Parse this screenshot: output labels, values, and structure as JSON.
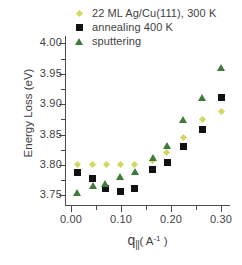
{
  "chart_data": {
    "type": "scatter",
    "title": "",
    "xlabel": "q|| ( A-1 )",
    "ylabel": "Energy Loss (eV)",
    "xlim": [
      -0.012,
      0.318
    ],
    "ylim": [
      3.7325,
      4.012
    ],
    "grid": false,
    "legend_position": "top-left-inside",
    "xticks": [
      0.0,
      0.1,
      0.2,
      0.3
    ],
    "xtick_labels": [
      "0.00",
      "0.10",
      "0.20",
      "0.30"
    ],
    "xticks_minor": [
      0.05,
      0.15,
      0.25
    ],
    "yticks": [
      3.75,
      3.8,
      3.85,
      3.9,
      3.95,
      4.0
    ],
    "ytick_labels": [
      "3.75",
      "3.80",
      "3.85",
      "3.90",
      "3.95",
      "4.00"
    ],
    "series": [
      {
        "name": "22 ML Ag/Cu(111), 300 K",
        "marker": "diamond",
        "color": "#d2d65e",
        "points": [
          {
            "x": 0.013,
            "y": 3.801
          },
          {
            "x": 0.042,
            "y": 3.8
          },
          {
            "x": 0.07,
            "y": 3.8
          },
          {
            "x": 0.098,
            "y": 3.801
          },
          {
            "x": 0.127,
            "y": 3.801
          },
          {
            "x": 0.163,
            "y": 3.807
          },
          {
            "x": 0.191,
            "y": 3.82
          },
          {
            "x": 0.225,
            "y": 3.845
          },
          {
            "x": 0.262,
            "y": 3.875
          },
          {
            "x": 0.301,
            "y": 3.888
          }
        ]
      },
      {
        "name": "annealing 400 K",
        "marker": "square",
        "color": "#111111",
        "points": [
          {
            "x": 0.012,
            "y": 3.788
          },
          {
            "x": 0.042,
            "y": 3.778
          },
          {
            "x": 0.068,
            "y": 3.761
          },
          {
            "x": 0.098,
            "y": 3.756
          },
          {
            "x": 0.127,
            "y": 3.761
          },
          {
            "x": 0.163,
            "y": 3.792
          },
          {
            "x": 0.192,
            "y": 3.804
          },
          {
            "x": 0.224,
            "y": 3.83
          },
          {
            "x": 0.262,
            "y": 3.858
          },
          {
            "x": 0.301,
            "y": 3.911
          }
        ]
      },
      {
        "name": "sputtering",
        "marker": "triangle",
        "color": "#3e7a38",
        "points": [
          {
            "x": 0.012,
            "y": 3.755
          },
          {
            "x": 0.044,
            "y": 3.766
          },
          {
            "x": 0.068,
            "y": 3.77
          },
          {
            "x": 0.098,
            "y": 3.781
          },
          {
            "x": 0.127,
            "y": 3.789
          },
          {
            "x": 0.163,
            "y": 3.813
          },
          {
            "x": 0.192,
            "y": 3.832
          },
          {
            "x": 0.224,
            "y": 3.874
          },
          {
            "x": 0.261,
            "y": 3.911
          },
          {
            "x": 0.3,
            "y": 3.961
          }
        ]
      }
    ]
  },
  "axes": {
    "y_title": "Energy Loss (eV)",
    "x_title_symbol": "q",
    "x_title_subscript": "||",
    "x_title_unit_open": "( A",
    "x_title_unit_exp": "-1",
    "x_title_unit_close": " )"
  },
  "legend": {
    "entries": [
      {
        "label": "22 ML Ag/Cu(111), 300 K",
        "marker": "diamond-marker"
      },
      {
        "label": "annealing 400 K",
        "marker": "square-marker"
      },
      {
        "label": "sputtering",
        "marker": "triangle-marker"
      }
    ]
  }
}
